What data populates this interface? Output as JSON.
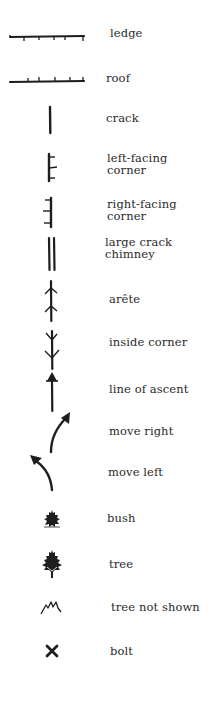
{
  "legend": {
    "items": [
      {
        "id": "ledge",
        "label": "ledge",
        "icon": "ledge-line-icon"
      },
      {
        "id": "roof",
        "label": "roof",
        "icon": "roof-line-icon"
      },
      {
        "id": "crack",
        "label": "crack",
        "icon": "crack-line-icon"
      },
      {
        "id": "left-facing-corner",
        "label_line1": "left-facing",
        "label_line2": "corner",
        "icon": "left-facing-corner-icon"
      },
      {
        "id": "right-facing-corner",
        "label_line1": "right-facing",
        "label_line2": "corner",
        "icon": "right-facing-corner-icon"
      },
      {
        "id": "large-crack-chimney",
        "label_line1": "large crack",
        "label_line2": "chimney",
        "icon": "double-line-icon"
      },
      {
        "id": "arete",
        "label": "arête",
        "icon": "arete-icon"
      },
      {
        "id": "inside-corner",
        "label": "inside corner",
        "icon": "inside-corner-icon"
      },
      {
        "id": "line-of-ascent",
        "label": "line of ascent",
        "icon": "arrow-up-icon"
      },
      {
        "id": "move-right",
        "label": "move right",
        "icon": "curved-arrow-right-icon"
      },
      {
        "id": "move-left",
        "label": "move left",
        "icon": "curved-arrow-left-icon"
      },
      {
        "id": "bush",
        "label": "bush",
        "icon": "bush-icon"
      },
      {
        "id": "tree",
        "label": "tree",
        "icon": "tree-icon"
      },
      {
        "id": "tree-not-shown",
        "label": "tree not shown",
        "icon": "zigzag-icon"
      },
      {
        "id": "bolt",
        "label": "bolt",
        "icon": "x-mark-icon"
      }
    ]
  },
  "colors": {
    "ink": "#1e1e1e",
    "text": "#2a2a2a",
    "background": "#ffffff"
  }
}
